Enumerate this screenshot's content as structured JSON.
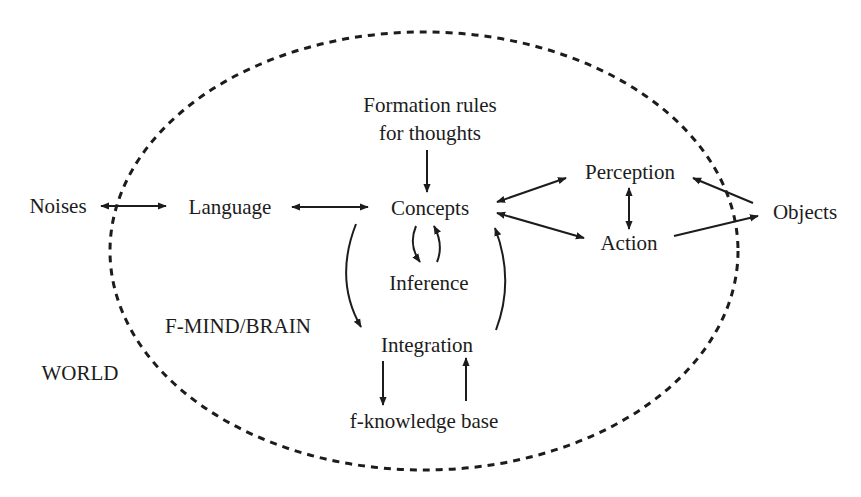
{
  "diagram": {
    "type": "flow-diagram",
    "boundary": {
      "style": "dashed-ellipse",
      "inside_label": "F-MIND/BRAIN",
      "outside_label": "WORLD"
    },
    "nodes": {
      "noises": "Noises",
      "language": "Language",
      "concepts": "Concepts",
      "formation_rules_line1": "Formation rules",
      "formation_rules_line2": "for thoughts",
      "inference": "Inference",
      "integration": "Integration",
      "knowledge_base": "f-knowledge base",
      "perception": "Perception",
      "action": "Action",
      "objects": "Objects"
    },
    "edges": [
      {
        "from": "Noises",
        "to": "Language",
        "direction": "both"
      },
      {
        "from": "Language",
        "to": "Concepts",
        "direction": "both"
      },
      {
        "from": "Formation rules for thoughts",
        "to": "Concepts",
        "direction": "forward"
      },
      {
        "from": "Concepts",
        "to": "Inference",
        "direction": "forward"
      },
      {
        "from": "Inference",
        "to": "Concepts",
        "direction": "forward"
      },
      {
        "from": "Concepts",
        "to": "Integration",
        "direction": "forward"
      },
      {
        "from": "Integration",
        "to": "Concepts",
        "direction": "forward"
      },
      {
        "from": "Integration",
        "to": "f-knowledge base",
        "direction": "forward"
      },
      {
        "from": "f-knowledge base",
        "to": "Integration",
        "direction": "forward"
      },
      {
        "from": "Concepts",
        "to": "Perception",
        "direction": "both"
      },
      {
        "from": "Concepts",
        "to": "Action",
        "direction": "both"
      },
      {
        "from": "Perception",
        "to": "Action",
        "direction": "both"
      },
      {
        "from": "Objects",
        "to": "Perception",
        "direction": "forward"
      },
      {
        "from": "Action",
        "to": "Objects",
        "direction": "forward"
      }
    ]
  },
  "labels": {
    "mind": "F-MIND/BRAIN",
    "world": "WORLD"
  },
  "colors": {
    "ink": "#1c1c1c",
    "background": "#ffffff"
  }
}
